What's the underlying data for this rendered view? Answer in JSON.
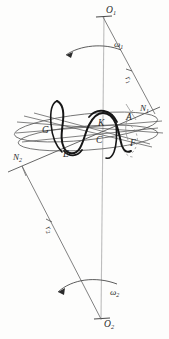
{
  "figure": {
    "kind": "hand-drawn kinematics diagram",
    "colors": {
      "ink": "#2b2b2b",
      "thin_line": "#555555",
      "axis_line": "#b9b9b9",
      "thick_curve": "#1a1a1a",
      "dashed": "#8a8a8a",
      "background": "#fdfdfc"
    }
  },
  "labels": {
    "axis_top": {
      "base": "O",
      "sub": "1"
    },
    "axis_bottom": {
      "base": "O",
      "sub": "2"
    },
    "omega_top": {
      "base": "ω",
      "sub": "1"
    },
    "omega_bottom": {
      "base": "ω",
      "sub": "2"
    },
    "radius_top": {
      "base": "r",
      "sub": "1"
    },
    "radius_bottom": {
      "base": "r",
      "sub": "2"
    },
    "node_right": {
      "base": "N",
      "sub": "1"
    },
    "node_left": {
      "base": "N",
      "sub": "2"
    },
    "point_a": {
      "base": "A",
      "sub": ""
    },
    "point_c": {
      "base": "C",
      "sub": ""
    },
    "point_e": {
      "base": "E",
      "sub": ""
    },
    "point_f": {
      "base": "F",
      "sub": ""
    },
    "point_g": {
      "base": "G",
      "sub": ""
    },
    "point_k": {
      "base": "K",
      "sub": ""
    }
  }
}
